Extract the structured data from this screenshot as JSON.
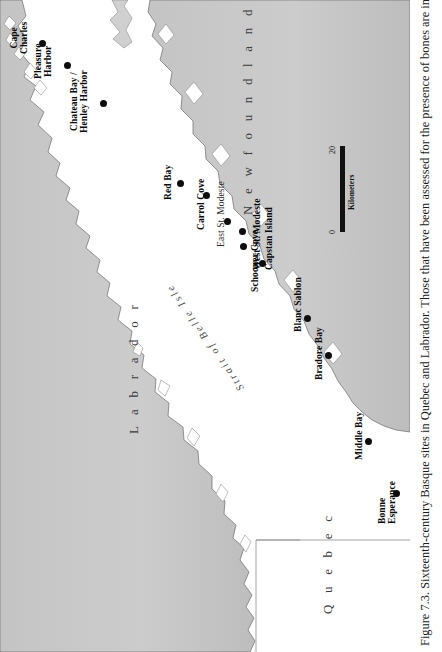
{
  "figure": {
    "caption": "Figure 7.3.  Sixteenth-century Basque sites in Quebec and Labrador. Those that have been assessed for the presence of bones are indicated"
  },
  "map": {
    "regions": [
      {
        "name": "labrador",
        "label": "L a b r a d o r"
      },
      {
        "name": "quebec",
        "label": "Q u e b e c"
      },
      {
        "name": "newfoundland",
        "label": "N e w f o u n d l a n d"
      }
    ],
    "water_labels": [
      {
        "name": "strait-of-belle-isle",
        "label": "Strait of Belle Isle"
      }
    ],
    "scale": {
      "min_label": "0",
      "max_label": "20",
      "units_label": "Kilometers"
    },
    "sites": [
      {
        "name": "cape-charles",
        "label": "Cape\nCharles"
      },
      {
        "name": "pleasure-harbor",
        "label": "Pleasure\nHarbor"
      },
      {
        "name": "chateau-bay",
        "label": "Chateau Bay /\nHenley Harbor"
      },
      {
        "name": "red-bay",
        "label": "Red Bay"
      },
      {
        "name": "carrol-cove",
        "label": "Carrol Cove"
      },
      {
        "name": "east-st-modeste",
        "label": "East St. Modeste"
      },
      {
        "name": "west-st-modeste",
        "label": "West St. Modeste"
      },
      {
        "name": "capstan-island",
        "label": "Capstan Island"
      },
      {
        "name": "schooner-cove",
        "label": "Schooner Cove"
      },
      {
        "name": "blanc-sablon",
        "label": "Blanc Sablon"
      },
      {
        "name": "bradore-bay",
        "label": "Bradore Bay"
      },
      {
        "name": "middle-bay",
        "label": "Middle Bay"
      },
      {
        "name": "bonne-esperance",
        "label": "Bonne\nEsperance"
      }
    ]
  },
  "colors": {
    "land_fill": "#c9c9c9",
    "water_fill": "#ffffff",
    "coastline": "#6b6b6b",
    "dot": "#0d0d0d",
    "label_text": "#0a0a0a"
  }
}
